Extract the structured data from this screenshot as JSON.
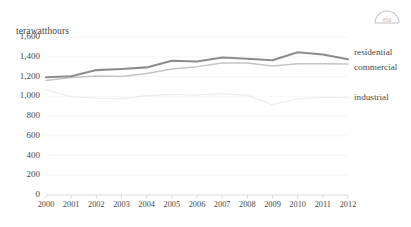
{
  "chart_data": {
    "type": "line",
    "title": "",
    "subtitle": "",
    "xlabel": "",
    "ylabel": "terawatthours",
    "ylim": [
      0,
      1600
    ],
    "ytick_labels": [
      "1,600",
      "1,400",
      "1,200",
      "1,000",
      "800",
      "600",
      "400",
      "200",
      "0"
    ],
    "ytick_values": [
      1600,
      1400,
      1200,
      1000,
      800,
      600,
      400,
      200,
      0
    ],
    "grid": true,
    "legend_position": "right",
    "x": [
      2000,
      2001,
      2002,
      2003,
      2004,
      2005,
      2006,
      2007,
      2008,
      2009,
      2010,
      2011,
      2012
    ],
    "categories": [
      "2000",
      "2001",
      "2002",
      "2003",
      "2004",
      "2005",
      "2006",
      "2007",
      "2008",
      "2009",
      "2010",
      "2011",
      "2012"
    ],
    "series": [
      {
        "name": "residential",
        "color": "#8c8c8c",
        "values": [
          1192,
          1203,
          1265,
          1276,
          1292,
          1359,
          1352,
          1392,
          1380,
          1364,
          1446,
          1423,
          1375
        ]
      },
      {
        "name": "commercial",
        "color": "#c4c4c4",
        "values": [
          1159,
          1191,
          1205,
          1199,
          1230,
          1275,
          1300,
          1336,
          1336,
          1307,
          1330,
          1328,
          1327
        ]
      },
      {
        "name": "industrial",
        "color": "#ededed",
        "values": [
          1064,
          997,
          982,
          977,
          1005,
          1019,
          1011,
          1028,
          1008,
          914,
          974,
          991,
          987
        ]
      }
    ]
  },
  "branding": {
    "logo_name": "eia-logo"
  }
}
